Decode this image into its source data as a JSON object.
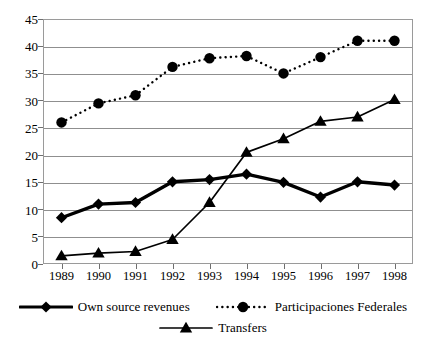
{
  "chart_data": {
    "type": "line",
    "title": "",
    "subtitle": "",
    "xlabel": "",
    "ylabel": "",
    "categories": [
      "1989",
      "1990",
      "1991",
      "1992",
      "1993",
      "1994",
      "1995",
      "1996",
      "1997",
      "1998"
    ],
    "ylim": [
      0,
      45
    ],
    "ytick_step": 5,
    "yticks": [
      "0",
      "5",
      "10",
      "15",
      "20",
      "25",
      "30",
      "35",
      "40",
      "45"
    ],
    "grid": true,
    "legend_position": "bottom",
    "series": [
      {
        "name": "Own source revenues",
        "marker": "diamond",
        "linestyle": "solid-thick",
        "color": "#000000",
        "values": [
          8.5,
          11.0,
          11.3,
          15.1,
          15.5,
          16.5,
          15.0,
          12.3,
          15.1,
          14.5
        ]
      },
      {
        "name": "Participaciones Federales",
        "marker": "circle",
        "linestyle": "dotted",
        "color": "#000000",
        "values": [
          26.0,
          29.5,
          31.0,
          36.2,
          37.8,
          38.2,
          35.0,
          38.0,
          41.0,
          41.0
        ]
      },
      {
        "name": "Transfers",
        "marker": "triangle",
        "linestyle": "solid",
        "color": "#000000",
        "values": [
          1.5,
          2.0,
          2.3,
          4.5,
          11.3,
          20.5,
          23.0,
          26.2,
          27.0,
          30.2
        ]
      }
    ]
  },
  "legend": {
    "rows": [
      [
        "Own source revenues",
        "Participaciones Federales"
      ],
      [
        "Transfers"
      ]
    ]
  }
}
